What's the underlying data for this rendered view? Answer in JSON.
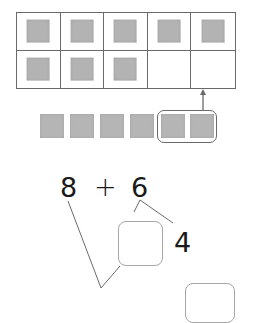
{
  "ten_frame": {
    "columns": 5,
    "rows": 2,
    "cells": [
      true,
      true,
      true,
      true,
      true,
      true,
      true,
      true,
      false,
      false
    ],
    "counter_color": "#b3b3b3",
    "line_color": "#6a6a6a"
  },
  "counters_row": {
    "count": 6,
    "grouped_count": 2,
    "counter_color": "#b5b5b5"
  },
  "equation": {
    "left": "8",
    "operator": "+",
    "right": "6",
    "split_part": "4",
    "answer_box_value": "",
    "result_box_value": ""
  }
}
